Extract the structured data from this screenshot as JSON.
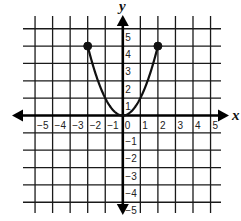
{
  "chart_data": {
    "type": "line",
    "title": "",
    "xlabel": "x",
    "ylabel": "y",
    "xlim": [
      -5,
      5
    ],
    "ylim": [
      -5,
      5
    ],
    "grid": true,
    "x_ticks": [
      "-5",
      "-4",
      "-3",
      "-2",
      "-1",
      "0",
      "1",
      "2",
      "3",
      "4",
      "5"
    ],
    "y_ticks": [
      "5",
      "4",
      "3",
      "2",
      "1",
      "-1",
      "-2",
      "-3",
      "-4",
      "-5"
    ],
    "series": [
      {
        "name": "y = x^2",
        "function": "x^2",
        "domain": [
          -2,
          2
        ],
        "x": [
          -2,
          -1.5,
          -1,
          -0.5,
          0,
          0.5,
          1,
          1.5,
          2
        ],
        "y": [
          4,
          2.25,
          1,
          0.25,
          0,
          0.25,
          1,
          2.25,
          4
        ],
        "endpoints": [
          {
            "x": -2,
            "y": 4,
            "style": "closed"
          },
          {
            "x": 2,
            "y": 4,
            "style": "closed"
          }
        ],
        "color": "#111111"
      }
    ],
    "colors": {
      "grid": "#1a1a1a",
      "axis": "#000000",
      "curve": "#111111"
    }
  }
}
